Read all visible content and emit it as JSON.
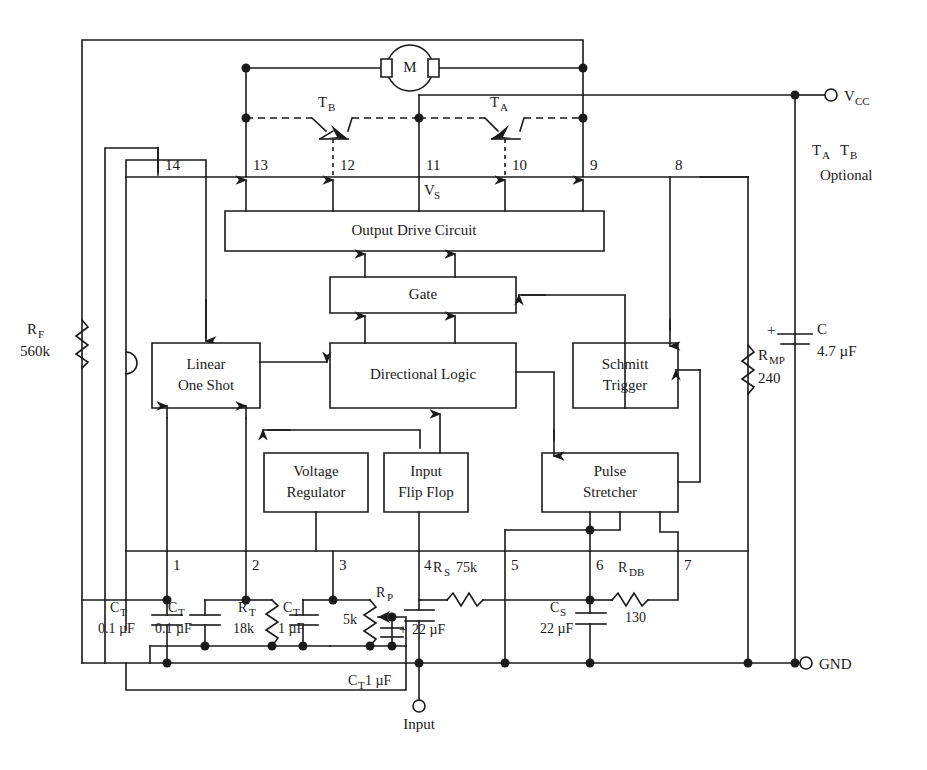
{
  "diagram": {
    "stroke_color": "#1a1a1a",
    "background": "#ffffff"
  },
  "blocks": [
    {
      "id": "output-drive-circuit",
      "label": "Output Drive Circuit",
      "x": 225,
      "y": 211,
      "w": 379,
      "h": 40
    },
    {
      "id": "gate",
      "label": "Gate",
      "x": 330,
      "y": 277,
      "w": 186,
      "h": 36
    },
    {
      "id": "linear-one-shot",
      "label_line1": "Linear",
      "label_line2": "One Shot",
      "x": 152,
      "y": 343,
      "w": 108,
      "h": 65
    },
    {
      "id": "directional-logic",
      "label": "Directional Logic",
      "x": 330,
      "y": 343,
      "w": 186,
      "h": 65
    },
    {
      "id": "schmitt-trigger",
      "label_line1": "Schmitt",
      "label_line2": "Trigger",
      "x": 573,
      "y": 343,
      "w": 105,
      "h": 65
    },
    {
      "id": "voltage-regulator",
      "label_line1": "Voltage",
      "label_line2": "Regulator",
      "x": 264,
      "y": 453,
      "w": 104,
      "h": 59
    },
    {
      "id": "input-flip-flop",
      "label_line1": "Input",
      "label_line2": "Flip Flop",
      "x": 384,
      "y": 453,
      "w": 84,
      "h": 59
    },
    {
      "id": "pulse-stretcher",
      "label_line1": "Pulse",
      "label_line2": "Stretcher",
      "x": 542,
      "y": 453,
      "w": 136,
      "h": 59
    }
  ],
  "pins": {
    "top_row": [
      {
        "num": "14",
        "x": 158
      },
      {
        "num": "13",
        "x": 246
      },
      {
        "num": "12",
        "x": 333
      },
      {
        "num": "11",
        "x": 419
      },
      {
        "num": "10",
        "x": 505
      },
      {
        "num": "9",
        "x": 583
      },
      {
        "num": "8",
        "x": 670
      }
    ],
    "bottom_row": [
      {
        "num": "1",
        "x": 167
      },
      {
        "num": "2",
        "x": 246
      },
      {
        "num": "3",
        "x": 333
      },
      {
        "num": "4",
        "x": 419
      },
      {
        "num": "5",
        "x": 505
      },
      {
        "num": "6",
        "x": 590
      },
      {
        "num": "7",
        "x": 678
      }
    ]
  },
  "labels": {
    "motor": "M",
    "vs": "V",
    "vs_sub": "S",
    "vcc": "V",
    "vcc_sub": "CC",
    "gnd": "GND",
    "input": "Input",
    "transistor_a": "T",
    "transistor_a_sub": "A",
    "transistor_b": "T",
    "transistor_b_sub": "B",
    "optional_note_line1_a": "T",
    "optional_note_line1_a_sub": "A",
    "optional_note_line1_b": "T",
    "optional_note_line1_b_sub": "B",
    "optional_note_line2": "Optional"
  },
  "components": [
    {
      "id": "rf",
      "type": "resistor",
      "name": "R",
      "name_sub": "F",
      "value": "560k"
    },
    {
      "id": "rmp",
      "type": "resistor",
      "name": "R",
      "name_sub": "MP",
      "value": "240"
    },
    {
      "id": "c-supply",
      "type": "capacitor-polarized",
      "name": "C",
      "value": "4.7 µF",
      "polarity": "+"
    },
    {
      "id": "ct1",
      "type": "capacitor",
      "name": "C",
      "name_sub": "T",
      "value": "0.1 µF"
    },
    {
      "id": "ct2",
      "type": "capacitor",
      "name": "C",
      "name_sub": "T",
      "value": "0.1 µF"
    },
    {
      "id": "rt",
      "type": "resistor",
      "name": "R",
      "name_sub": "T",
      "value": "18k"
    },
    {
      "id": "ct3",
      "type": "capacitor",
      "name": "C",
      "name_sub": "T",
      "value": "1 µF"
    },
    {
      "id": "rp",
      "type": "potentiometer",
      "name": "R",
      "name_sub": "P",
      "value": "5k"
    },
    {
      "id": "ct4",
      "type": "capacitor",
      "name": "C",
      "name_sub": "T",
      "value": "1 µF"
    },
    {
      "id": "c-input",
      "type": "capacitor-polarized",
      "value": "22 µF",
      "polarity": "+"
    },
    {
      "id": "rs",
      "type": "resistor",
      "name": "R",
      "name_sub": "S",
      "value": "75k"
    },
    {
      "id": "cs",
      "type": "capacitor",
      "name": "C",
      "name_sub": "S",
      "value": "22 µF"
    },
    {
      "id": "rdb",
      "type": "resistor",
      "name": "R",
      "name_sub": "DB",
      "value": "130"
    }
  ],
  "component_text": {
    "rf_name": "R",
    "rf_sub": "F",
    "rf_value": "560k",
    "rmp_name": "R",
    "rmp_sub": "MP",
    "rmp_value": "240",
    "c_name": "C",
    "c_value": "4.7 µF",
    "c_plus": "+",
    "ct1_name": "C",
    "ct1_sub": "T",
    "ct1_value": "0.1 µF",
    "ct2_name": "C",
    "ct2_sub": "T",
    "ct2_value": "0.1 µF",
    "rt_name": "R",
    "rt_sub": "T",
    "rt_value": "18k",
    "ct3_name": "C",
    "ct3_sub": "T",
    "ct3_value": "1 µF",
    "rp_name": "R",
    "rp_sub": "P",
    "rp_value": "5k",
    "ct4_name": "C",
    "ct4_sub": "T",
    "ct4_value": "1 µF",
    "cin_value": "22 µF",
    "cin_plus": "+",
    "rs_name": "R",
    "rs_sub": "S",
    "rs_value": "75k",
    "cs_name": "C",
    "cs_sub": "S",
    "cs_value": "22 µF",
    "rdb_name": "R",
    "rdb_sub": "DB",
    "rdb_value": "130"
  }
}
